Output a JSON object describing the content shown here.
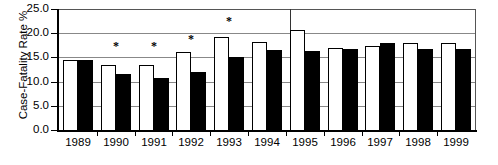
{
  "chart_data": {
    "type": "bar",
    "title": "",
    "xlabel": "",
    "ylabel": "Case-Fatality Rate %",
    "categories": [
      "1989",
      "1990",
      "1991",
      "1992",
      "1993",
      "1994",
      "1995",
      "1996",
      "1997",
      "1998",
      "1999"
    ],
    "ylim": [
      0.0,
      25.0
    ],
    "ytick_labels": [
      "0.0",
      "5.0",
      "10.0",
      "15.0",
      "20.0",
      "25.0"
    ],
    "ytick_values": [
      0.0,
      5.0,
      10.0,
      15.0,
      20.0,
      25.0
    ],
    "grid": true,
    "legend_position": "none",
    "series": [
      {
        "name": "open-bar",
        "fill": "white",
        "values": [
          14.4,
          13.5,
          13.5,
          16.2,
          19.2,
          18.2,
          20.6,
          17.0,
          17.3,
          18.0,
          18.0
        ]
      },
      {
        "name": "filled-bar",
        "fill": "black",
        "values": [
          14.4,
          11.5,
          10.7,
          12.0,
          15.0,
          16.5,
          16.3,
          16.8,
          18.0,
          16.7,
          16.8
        ]
      }
    ],
    "annotations": [
      {
        "label": "*",
        "category": "1990",
        "value": 17.3
      },
      {
        "label": "*",
        "category": "1991",
        "value": 17.4
      },
      {
        "label": "*",
        "category": "1992",
        "value": 18.7
      },
      {
        "label": "*",
        "category": "1993",
        "value": 22.5
      }
    ]
  },
  "axis": {
    "y_title": "Case-Fatality Rate %"
  }
}
